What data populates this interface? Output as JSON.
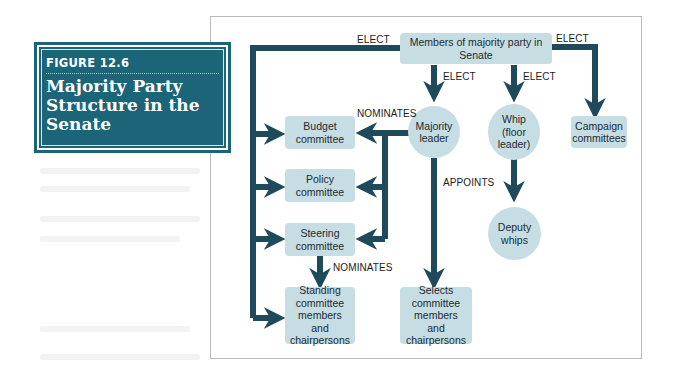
{
  "figure": {
    "label": "FIGURE 12.6",
    "title": "Majority Party Structure in the Senate"
  },
  "colors": {
    "accent": "#1c6477",
    "arrow": "#1e4a5c",
    "node_fill": "#c5dde3",
    "panel_border": "#b9bcbd"
  },
  "nodes": {
    "members": "Members of majority party in Senate",
    "majority_leader": "Majority leader",
    "whip": "Whip (floor leader)",
    "campaign": "Campaign committees",
    "budget": "Budget committee",
    "policy": "Policy committee",
    "steering": "Steering committee",
    "standing": "Standing committee members and chairpersons",
    "deputy_whips": "Deputy whips",
    "selects": "Selects committee members and chairpersons"
  },
  "edge_labels": {
    "elect_left": "ELECT",
    "elect_right": "ELECT",
    "elect_leader": "ELECT",
    "elect_whip": "ELECT",
    "nominates_leader": "NOMINATES",
    "appoints": "APPOINTS",
    "nominates_steering": "NOMINATES"
  },
  "diagram_edges": [
    {
      "from": "Members of majority party in Senate",
      "to": [
        "Budget committee",
        "Policy committee",
        "Steering committee",
        "Standing committee members and chairpersons"
      ],
      "label": "ELECT"
    },
    {
      "from": "Members of majority party in Senate",
      "to": "Campaign committees",
      "label": "ELECT"
    },
    {
      "from": "Members of majority party in Senate",
      "to": "Majority leader",
      "label": "ELECT"
    },
    {
      "from": "Members of majority party in Senate",
      "to": "Whip (floor leader)",
      "label": "ELECT"
    },
    {
      "from": "Majority leader",
      "to": [
        "Budget committee",
        "Policy committee",
        "Steering committee"
      ],
      "label": "NOMINATES"
    },
    {
      "from": "Majority leader",
      "to": "Selects committee members and chairpersons",
      "label": "APPOINTS"
    },
    {
      "from": "Whip (floor leader)",
      "to": "Deputy whips",
      "label": ""
    },
    {
      "from": "Steering committee",
      "to": "Standing committee members and chairpersons",
      "label": "NOMINATES"
    }
  ]
}
